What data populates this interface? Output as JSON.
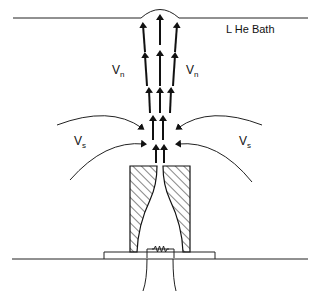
{
  "diagram": {
    "bath_label": "L He Bath",
    "normal_velocity_label": "V",
    "normal_velocity_sub": "n",
    "super_velocity_label": "V",
    "super_velocity_sub": "s",
    "heater_symbol": "resistor-icon"
  }
}
